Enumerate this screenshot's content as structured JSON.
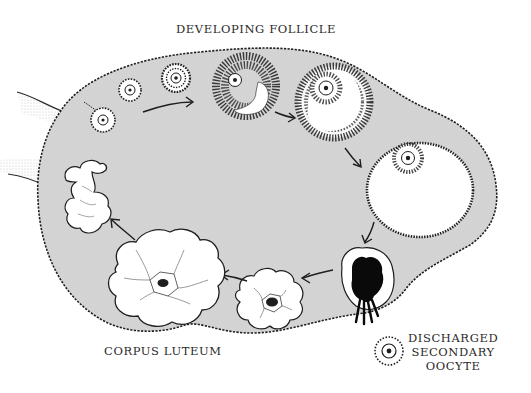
{
  "diagram": {
    "colors": {
      "ovary_fill": "#d4d4d4",
      "outline": "#1e1e1e",
      "follicle_cavity": "#ffffff",
      "ruptured_blood_clot": "#0a0a0a"
    },
    "labels": {
      "developing_follicle": "DEVELOPING FOLLICLE",
      "corpus_luteum": "CORPUS LUTEUM",
      "discharged_oocyte": {
        "line1": "DISCHARGED",
        "line2": "SECONDARY",
        "line3": "OOCYTE"
      }
    },
    "stages": [
      {
        "id": 1,
        "name": "primordial follicle"
      },
      {
        "id": 2,
        "name": "primary follicle"
      },
      {
        "id": 3,
        "name": "growing follicle"
      },
      {
        "id": 4,
        "name": "secondary follicle with antrum"
      },
      {
        "id": 5,
        "name": "larger antral follicle"
      },
      {
        "id": 6,
        "name": "mature (Graafian) follicle"
      },
      {
        "id": 7,
        "name": "ruptured follicle / ovulation"
      },
      {
        "id": 8,
        "name": "early corpus luteum"
      },
      {
        "id": 9,
        "name": "mature corpus luteum"
      },
      {
        "id": 10,
        "name": "corpus albicans"
      }
    ]
  }
}
